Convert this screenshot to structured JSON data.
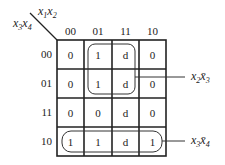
{
  "kmap": {
    "corner": {
      "top_var": {
        "a": "x",
        "a_sub": "1",
        "b": "x",
        "b_sub": "2"
      },
      "left_var": {
        "a": "x",
        "a_sub": "3",
        "b": "x",
        "b_sub": "4"
      }
    },
    "col_headers": [
      "00",
      "01",
      "11",
      "10"
    ],
    "row_headers": [
      "00",
      "01",
      "11",
      "10"
    ],
    "cells": [
      [
        "0",
        "1",
        "d",
        "0"
      ],
      [
        "0",
        "1",
        "d",
        "0"
      ],
      [
        "0",
        "0",
        "d",
        "0"
      ],
      [
        "1",
        "1",
        "d",
        "1"
      ]
    ],
    "groups": [
      {
        "label_var1": "x",
        "label_sub1": "2",
        "label_var2": "x̄",
        "label_sub2": "3",
        "cells": "rows 00-01, cols 01-11"
      },
      {
        "label_var1": "x",
        "label_sub1": "3",
        "label_var2": "x̄",
        "label_sub2": "4",
        "cells": "row 10, all cols"
      }
    ]
  }
}
